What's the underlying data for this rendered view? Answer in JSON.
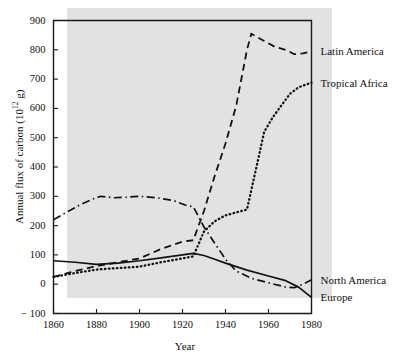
{
  "figure": {
    "background_color": "#ffffff",
    "band_color": "#e2e2e2",
    "line_color": "#111111"
  },
  "axis": {
    "y_title_prefix": "Annual flux of carbon (10",
    "y_title_exponent": "12",
    "y_title_suffix": " g)",
    "x_title": "Year",
    "y_ticks": [
      "900",
      "800",
      "700",
      "600",
      "500",
      "400",
      "300",
      "200",
      "100",
      "0",
      "− 100"
    ],
    "x_ticks": [
      "1860",
      "1880",
      "1900",
      "1920",
      "1940",
      "1960",
      "1980"
    ]
  },
  "series_labels": {
    "latin_america": "Latin America",
    "tropical_africa": "Tropical Africa",
    "north_america": "North America",
    "europe": "Europe"
  },
  "chart_data": {
    "type": "line",
    "title": "",
    "xlabel": "Year",
    "ylabel": "Annual flux of carbon (10^12 g)",
    "xlim": [
      1860,
      1980
    ],
    "ylim": [
      -100,
      900
    ],
    "xticks": [
      1860,
      1880,
      1900,
      1920,
      1940,
      1960,
      1980
    ],
    "yticks": [
      -100,
      0,
      100,
      200,
      300,
      400,
      500,
      600,
      700,
      800,
      900
    ],
    "grid": false,
    "legend_position": "right-of-axes-inline",
    "series": [
      {
        "name": "Latin America",
        "style": "dashed",
        "x": [
          1860,
          1870,
          1880,
          1890,
          1900,
          1910,
          1920,
          1925,
          1930,
          1935,
          1940,
          1945,
          1950,
          1952,
          1958,
          1963,
          1968,
          1972,
          1976,
          1980
        ],
        "values": [
          25,
          45,
          62,
          75,
          88,
          120,
          145,
          150,
          250,
          370,
          480,
          610,
          800,
          855,
          830,
          810,
          800,
          785,
          788,
          795
        ]
      },
      {
        "name": "Tropical Africa",
        "style": "dotted",
        "x": [
          1860,
          1870,
          1880,
          1890,
          1900,
          1910,
          1920,
          1925,
          1930,
          1935,
          1940,
          1945,
          1950,
          1955,
          1958,
          1962,
          1966,
          1970,
          1974,
          1980
        ],
        "values": [
          25,
          38,
          50,
          55,
          60,
          75,
          88,
          95,
          180,
          215,
          235,
          245,
          255,
          420,
          520,
          570,
          610,
          650,
          672,
          688
        ]
      },
      {
        "name": "North America",
        "style": "dash-dot",
        "x": [
          1860,
          1866,
          1872,
          1878,
          1882,
          1888,
          1894,
          1900,
          1908,
          1916,
          1922,
          1925,
          1930,
          1935,
          1940,
          1945,
          1952,
          1960,
          1968,
          1972,
          1976,
          1980
        ],
        "values": [
          220,
          245,
          270,
          290,
          300,
          295,
          297,
          300,
          295,
          285,
          268,
          265,
          195,
          140,
          85,
          45,
          20,
          5,
          -10,
          -12,
          0,
          15
        ]
      },
      {
        "name": "Europe",
        "style": "solid",
        "x": [
          1860,
          1870,
          1880,
          1890,
          1900,
          1910,
          1920,
          1925,
          1930,
          1935,
          1940,
          1950,
          1960,
          1968,
          1974,
          1980
        ],
        "values": [
          80,
          75,
          68,
          72,
          80,
          90,
          100,
          105,
          98,
          85,
          72,
          48,
          28,
          12,
          -10,
          -45
        ]
      }
    ]
  }
}
